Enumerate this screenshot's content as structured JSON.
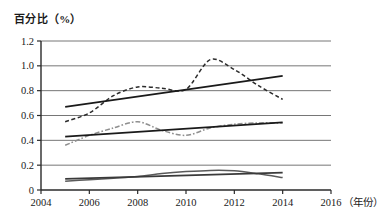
{
  "chart_data": {
    "type": "line",
    "title": "",
    "ylabel": "百分比（%）",
    "xlabel": "（年份）",
    "xlim": [
      2004,
      2016
    ],
    "ylim": [
      0,
      1.2
    ],
    "grid": true,
    "legend": "none",
    "y_ticks": [
      "0",
      "0.2",
      "0.4",
      "0.6",
      "0.8",
      "1.0",
      "1.2"
    ],
    "y_tick_values": [
      0,
      0.2,
      0.4,
      0.6,
      0.8,
      1.0,
      1.2
    ],
    "x_ticks": [
      "2004",
      "2006",
      "2008",
      "2010",
      "2012",
      "2014",
      "2016"
    ],
    "x_tick_values": [
      2004,
      2006,
      2008,
      2010,
      2012,
      2014,
      2016
    ],
    "x": [
      2005,
      2006,
      2007,
      2008,
      2009,
      2010,
      2011,
      2012,
      2013,
      2014
    ],
    "series": [
      {
        "name": "upper-data",
        "style": "dashed",
        "color": "#2b2b2b",
        "values": [
          0.55,
          0.62,
          0.76,
          0.83,
          0.82,
          0.81,
          1.05,
          0.97,
          0.84,
          0.73
        ]
      },
      {
        "name": "upper-trend",
        "style": "solid",
        "color": "#1a1a1a",
        "values": [
          0.67,
          0.7,
          0.73,
          0.76,
          0.79,
          0.81,
          0.84,
          0.87,
          0.9,
          0.92
        ]
      },
      {
        "name": "middle-data",
        "style": "dash-dot",
        "color": "#8f8f8f",
        "values": [
          0.36,
          0.44,
          0.5,
          0.55,
          0.48,
          0.44,
          0.5,
          0.53,
          0.54,
          0.54
        ]
      },
      {
        "name": "middle-trend",
        "style": "solid",
        "color": "#1a1a1a",
        "values": [
          0.43,
          0.444,
          0.457,
          0.47,
          0.483,
          0.496,
          0.51,
          0.522,
          0.535,
          0.545
        ]
      },
      {
        "name": "lower-data",
        "style": "solid",
        "color": "#5a5a5a",
        "values": [
          0.07,
          0.083,
          0.095,
          0.108,
          0.132,
          0.148,
          0.158,
          0.155,
          0.13,
          0.1
        ]
      },
      {
        "name": "lower-trend",
        "style": "solid",
        "color": "#3a3a3a",
        "values": [
          0.09,
          0.095,
          0.1,
          0.107,
          0.128,
          0.132,
          0.134,
          0.136,
          0.138,
          0.14
        ]
      }
    ]
  }
}
